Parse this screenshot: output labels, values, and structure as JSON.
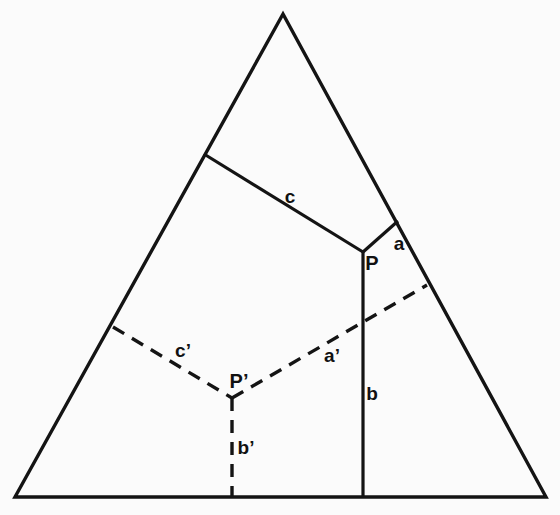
{
  "figure": {
    "background_color": "#fbfbfb",
    "stroke_color": "#141414",
    "width": 560,
    "height": 515
  },
  "triangle": {
    "name": "outer-triangle",
    "apex": {
      "x": 283,
      "y": 14
    },
    "left_base": {
      "x": 15,
      "y": 497
    },
    "right_base": {
      "x": 546,
      "y": 497
    }
  },
  "points": [
    {
      "id": "P",
      "label": "P",
      "x": 363,
      "y": 252,
      "label_x": 372,
      "label_y": 263,
      "style": "solid"
    },
    {
      "id": "Pprime",
      "label": "P’",
      "x": 232,
      "y": 398,
      "label_x": 239,
      "label_y": 381,
      "style": "dashed"
    }
  ],
  "segments": [
    {
      "id": "c",
      "label": "c",
      "style": "solid",
      "from": {
        "x": 204,
        "y": 154
      },
      "to": {
        "x": 363,
        "y": 252
      },
      "label_x": 290,
      "label_y": 196
    },
    {
      "id": "a",
      "label": "a",
      "style": "solid",
      "from": {
        "x": 363,
        "y": 252
      },
      "to": {
        "x": 398,
        "y": 221
      },
      "label_x": 399,
      "label_y": 243
    },
    {
      "id": "b",
      "label": "b",
      "style": "solid",
      "from": {
        "x": 363,
        "y": 252
      },
      "to": {
        "x": 363,
        "y": 497
      },
      "label_x": 372,
      "label_y": 393
    },
    {
      "id": "cprime",
      "label": "c’",
      "style": "dashed",
      "from": {
        "x": 113,
        "y": 327
      },
      "to": {
        "x": 232,
        "y": 398
      },
      "label_x": 183,
      "label_y": 350
    },
    {
      "id": "aprime",
      "label": "a’",
      "style": "dashed",
      "from": {
        "x": 232,
        "y": 398
      },
      "to": {
        "x": 427,
        "y": 285
      },
      "label_x": 332,
      "label_y": 355
    },
    {
      "id": "bprime",
      "label": "b’",
      "style": "dashed",
      "from": {
        "x": 232,
        "y": 398
      },
      "to": {
        "x": 232,
        "y": 497
      },
      "label_x": 246,
      "label_y": 447
    }
  ],
  "labels": {
    "c": "c",
    "a": "a",
    "b": "b",
    "c_prime": "c’",
    "a_prime": "a’",
    "b_prime": "b’",
    "p": "P",
    "p_prime": "P’"
  }
}
